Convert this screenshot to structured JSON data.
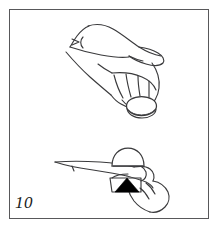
{
  "figure": {
    "number_label": "10",
    "panel_type": "line-drawing illustration",
    "caption": "",
    "border_color": "#58585a",
    "background_color": "#ffffff",
    "ink_color": "#3a3a3c",
    "fill_color": "#000000"
  },
  "illustration": {
    "title": "Hand holding a round disc between fingers, two views",
    "subjects": [
      {
        "name": "upper-hand",
        "description": "Hand seen from the side, palm downward, fingers curled holding a round disc at the fingertips",
        "elements": [
          "wrist",
          "palm",
          "thumb",
          "four-fingers",
          "knuckle-lines",
          "disc"
        ]
      },
      {
        "name": "lower-hand",
        "description": "Closer view of the same hand from the front, disc held between thumb and fingers with an upward pointing arrow",
        "elements": [
          "wrist",
          "thumb",
          "fingers",
          "disc",
          "arrow"
        ]
      }
    ],
    "annotations": [
      {
        "name": "motion-arrow-upper",
        "type": "caret-arrow",
        "direction": "right",
        "meaning": "indicates direction of motion at the wrist"
      },
      {
        "name": "direction-arrow-lower",
        "type": "solid-triangle",
        "direction": "up",
        "color": "#000000",
        "meaning": "indicates the disc is pushed upward"
      }
    ],
    "objects": [
      {
        "name": "disc-upper",
        "shape": "ellipse",
        "held_by": "fingertips"
      },
      {
        "name": "disc-lower",
        "shape": "dome",
        "held_by": "thumb-and-fingers"
      }
    ]
  }
}
